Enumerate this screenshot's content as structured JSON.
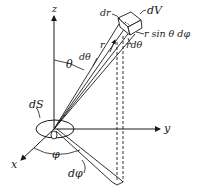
{
  "diagram": {
    "type": "spherical-coordinates-volume-element",
    "axes": {
      "z": "z",
      "y": "y",
      "x": "x"
    },
    "origin_label": "O",
    "labels": {
      "dV": "dV",
      "dr": "dr",
      "r": "r",
      "r_sin_theta_dphi": "r sin θ dφ",
      "r_dtheta": "rdθ",
      "theta": "θ",
      "dtheta": "dθ",
      "phi": "φ",
      "dphi": "dφ",
      "dS": "dS"
    },
    "colors": {
      "ink": "#1a1a1a",
      "background": "#ffffff"
    }
  }
}
